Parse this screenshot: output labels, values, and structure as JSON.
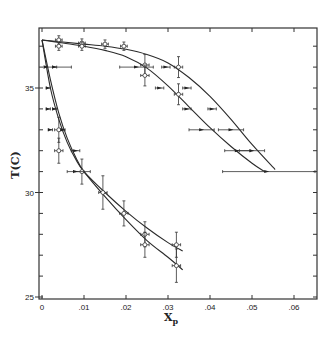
{
  "chart_data": {
    "type": "line",
    "title": "",
    "xlabel": "Xp",
    "xlabel_main": "X",
    "xlabel_sub": "p",
    "ylabel": "T(C)",
    "xlim": [
      0,
      0.065
    ],
    "ylim": [
      25,
      37.9
    ],
    "grid": false,
    "legend": null,
    "x_ticks": [
      0,
      0.01,
      0.02,
      0.03,
      0.04,
      0.05,
      0.06
    ],
    "x_tick_labels": [
      "0",
      ".01",
      ".02",
      ".03",
      ".04",
      ".05",
      ".06"
    ],
    "y_ticks": [
      25,
      30,
      35
    ],
    "y_tick_labels": [
      "25",
      "30",
      "35"
    ],
    "y_minor_step": 1,
    "series": [
      {
        "name": "upper-outer-curve",
        "type": "curve",
        "x": [
          0,
          0.005,
          0.01,
          0.015,
          0.02,
          0.025,
          0.03,
          0.035,
          0.04,
          0.045,
          0.05,
          0.0555
        ],
        "y": [
          37.3,
          37.2,
          37.1,
          37.0,
          36.85,
          36.6,
          36.2,
          35.5,
          34.6,
          33.5,
          32.3,
          31.1
        ]
      },
      {
        "name": "upper-inner-curve",
        "type": "curve",
        "x": [
          0,
          0.005,
          0.01,
          0.015,
          0.02,
          0.025,
          0.03,
          0.035,
          0.04,
          0.045,
          0.05,
          0.053
        ],
        "y": [
          37.3,
          37.15,
          37.0,
          36.8,
          36.5,
          35.95,
          35.1,
          34.1,
          33.1,
          32.2,
          31.4,
          31.0
        ]
      },
      {
        "name": "lower-upper-curve",
        "type": "curve",
        "x": [
          0,
          0.002,
          0.004,
          0.006,
          0.008,
          0.01,
          0.015,
          0.02,
          0.025,
          0.03,
          0.0335
        ],
        "y": [
          37.3,
          35.0,
          33.5,
          32.4,
          31.6,
          31.0,
          30.0,
          29.1,
          28.3,
          27.6,
          27.2
        ]
      },
      {
        "name": "lower-lower-curve",
        "type": "curve",
        "x": [
          0,
          0.002,
          0.004,
          0.006,
          0.008,
          0.01,
          0.015,
          0.02,
          0.025,
          0.03,
          0.0335
        ],
        "y": [
          37.3,
          35.4,
          33.8,
          32.6,
          31.7,
          31.0,
          29.8,
          28.7,
          27.7,
          26.9,
          26.3
        ]
      },
      {
        "name": "open-circle-points",
        "type": "scatter",
        "marker": "open-circle",
        "points": [
          {
            "x": 0.004,
            "y": 37.3,
            "xerr": 0.0008,
            "yerr": 0.2
          },
          {
            "x": 0.004,
            "y": 37.0,
            "xerr": 0.0008,
            "yerr": 0.2
          },
          {
            "x": 0.0095,
            "y": 37.15,
            "xerr": 0.0008,
            "yerr": 0.2
          },
          {
            "x": 0.0095,
            "y": 37.0,
            "xerr": 0.0008,
            "yerr": 0.2
          },
          {
            "x": 0.015,
            "y": 37.1,
            "xerr": 0.0008,
            "yerr": 0.2
          },
          {
            "x": 0.0195,
            "y": 37.0,
            "xerr": 0.0008,
            "yerr": 0.2
          },
          {
            "x": 0.0245,
            "y": 36.1,
            "xerr": 0.001,
            "yerr": 0.5
          },
          {
            "x": 0.0245,
            "y": 35.6,
            "xerr": 0.001,
            "yerr": 0.5
          },
          {
            "x": 0.0325,
            "y": 36.0,
            "xerr": 0.001,
            "yerr": 0.5
          },
          {
            "x": 0.0325,
            "y": 34.7,
            "xerr": 0.001,
            "yerr": 0.5
          },
          {
            "x": 0.004,
            "y": 33.0,
            "xerr": 0.001,
            "yerr": 0.6
          },
          {
            "x": 0.004,
            "y": 32.0,
            "xerr": 0.001,
            "yerr": 0.6
          },
          {
            "x": 0.0095,
            "y": 31.0,
            "xerr": 0.002,
            "yerr": 0.6
          },
          {
            "x": 0.0145,
            "y": 30.0,
            "xerr": 0.001,
            "yerr": 0.8
          },
          {
            "x": 0.0195,
            "y": 29.0,
            "xerr": 0.001,
            "yerr": 0.6
          },
          {
            "x": 0.0245,
            "y": 28.0,
            "xerr": 0.001,
            "yerr": 0.6
          },
          {
            "x": 0.0245,
            "y": 27.5,
            "xerr": 0.001,
            "yerr": 0.6
          },
          {
            "x": 0.032,
            "y": 27.5,
            "xerr": 0.001,
            "yerr": 0.6
          },
          {
            "x": 0.032,
            "y": 26.5,
            "xerr": 0.001,
            "yerr": 0.8
          }
        ]
      },
      {
        "name": "filled-points",
        "type": "scatter",
        "marker": "filled",
        "points": [
          {
            "x": 0.001,
            "y": 36.0,
            "xerr_left": 0.0005,
            "xerr_right": 0.006
          },
          {
            "x": 0.003,
            "y": 36.0,
            "xerr": 0.0005
          },
          {
            "x": 0.0015,
            "y": 35.0,
            "xerr": 0.0005
          },
          {
            "x": 0.0015,
            "y": 34.0,
            "xerr": 0.0005
          },
          {
            "x": 0.003,
            "y": 34.0,
            "xerr": 0.0005
          },
          {
            "x": 0.002,
            "y": 33.0,
            "xerr": 0.0005
          },
          {
            "x": 0.005,
            "y": 33.0,
            "xerr": 0.0005
          },
          {
            "x": 0.008,
            "y": 32.0,
            "xerr": 0.001
          },
          {
            "x": 0.008,
            "y": 31.0,
            "xerr": 0.002
          },
          {
            "x": 0.0225,
            "y": 36.0,
            "xerr": 0.004
          },
          {
            "x": 0.0295,
            "y": 36.0,
            "xerr": 0.001
          },
          {
            "x": 0.028,
            "y": 35.0,
            "xerr": 0.001
          },
          {
            "x": 0.0345,
            "y": 35.0,
            "xerr": 0.001
          },
          {
            "x": 0.0345,
            "y": 34.0,
            "xerr": 0.001
          },
          {
            "x": 0.0405,
            "y": 34.0,
            "xerr": 0.001
          },
          {
            "x": 0.038,
            "y": 33.0,
            "xerr": 0.003
          },
          {
            "x": 0.045,
            "y": 33.0,
            "xerr": 0.003
          },
          {
            "x": 0.0465,
            "y": 32.0,
            "xerr": 0.003
          },
          {
            "x": 0.05,
            "y": 32.0,
            "xerr": 0.003
          },
          {
            "x": 0.0535,
            "y": 31.0,
            "xerr_left": 0.0105,
            "xerr_right": 0.0115
          }
        ]
      }
    ]
  }
}
